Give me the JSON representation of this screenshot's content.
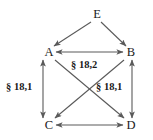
{
  "diagram": {
    "type": "directed-graph",
    "background_color": "#ffffff",
    "line_color": "#5a5a5a",
    "text_color": "#1a1a1a",
    "nodes": [
      {
        "id": "E",
        "label": "E",
        "x": 96,
        "y": 14
      },
      {
        "id": "A",
        "label": "A",
        "x": 48,
        "y": 53
      },
      {
        "id": "B",
        "label": "B",
        "x": 130,
        "y": 53
      },
      {
        "id": "C",
        "label": "C",
        "x": 48,
        "y": 125
      },
      {
        "id": "D",
        "label": "D",
        "x": 130,
        "y": 125
      }
    ],
    "edges": [
      {
        "from": "E",
        "to": "A",
        "arrows": "single"
      },
      {
        "from": "E",
        "to": "B",
        "arrows": "single"
      },
      {
        "from": "A",
        "to": "B",
        "arrows": "double"
      },
      {
        "from": "A",
        "to": "C",
        "arrows": "double"
      },
      {
        "from": "B",
        "to": "D",
        "arrows": "double"
      },
      {
        "from": "C",
        "to": "D",
        "arrows": "double"
      },
      {
        "from": "A",
        "to": "D",
        "arrows": "single"
      },
      {
        "from": "B",
        "to": "C",
        "arrows": "single"
      }
    ],
    "edge_labels": [
      {
        "id": "label-left",
        "text": "§ 18,1",
        "x": 8,
        "y": 88
      },
      {
        "id": "label-center-top",
        "text": "§ 18,2",
        "x": 74,
        "y": 65
      },
      {
        "id": "label-center-right",
        "text": "§ 18,1",
        "x": 99,
        "y": 87
      }
    ]
  }
}
